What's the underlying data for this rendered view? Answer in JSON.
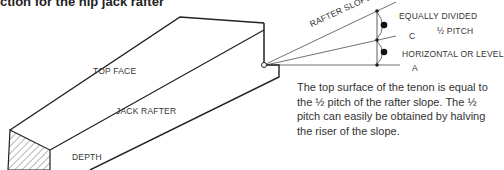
{
  "title": "ction for the hip jack rafter",
  "labels": {
    "top_face": "TOP FACE",
    "jack_rafter": "JACK RAFTER",
    "depth": "DEPTH",
    "rafter_slope": "RAFTER SLOPE",
    "equally_divided": "EQUALLY DIVIDED",
    "half_pitch": "½ PITCH",
    "point_c": "C",
    "horizontal": "HORIZONTAL OR LEVEL",
    "point_a": "A"
  },
  "description": "The top surface of the tenon is equal to the ½ pitch of the rafter slope. The ½ pitch can easily be obtained by halving the riser of the slope."
}
